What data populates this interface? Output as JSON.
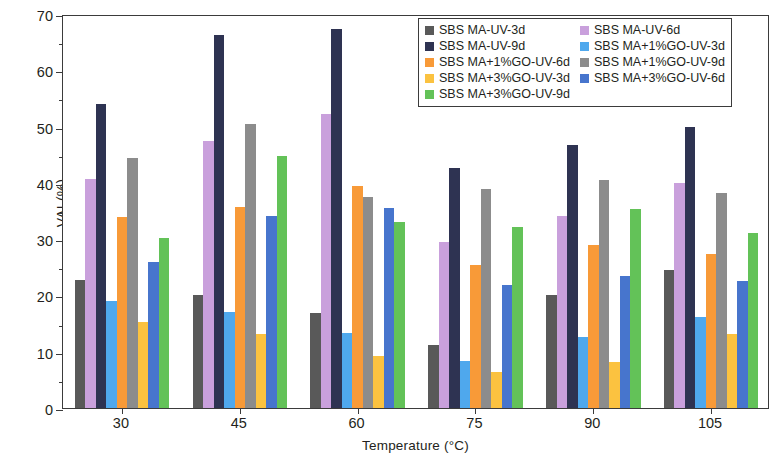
{
  "chart_data": {
    "type": "bar",
    "title": "",
    "xlabel": "Temperature (°C)",
    "ylabel": "VAI (%)",
    "categories": [
      "30",
      "45",
      "60",
      "75",
      "90",
      "105"
    ],
    "ylim": [
      0,
      70
    ],
    "ytick_major": [
      0,
      10,
      20,
      30,
      40,
      50,
      60,
      70
    ],
    "ytick_minor": [
      5,
      15,
      25,
      35,
      45,
      55,
      65
    ],
    "grid": false,
    "legend_position": "top-right inside",
    "series": [
      {
        "name": "SBS MA-UV-3d",
        "color": "#595959",
        "values": [
          22.7,
          20.1,
          16.8,
          11.2,
          20.1,
          24.6
        ]
      },
      {
        "name": "SBS MA-UV-6d",
        "color": "#c9a0dc",
        "values": [
          40.7,
          47.5,
          52.3,
          29.5,
          34.1,
          39.9
        ]
      },
      {
        "name": "SBS MA-UV-9d",
        "color": "#2e3352",
        "values": [
          54.0,
          66.3,
          67.3,
          42.7,
          46.8,
          49.9
        ]
      },
      {
        "name": "SBS MA+1%GO-UV-3d",
        "color": "#4fa8ed",
        "values": [
          19.0,
          17.1,
          13.3,
          8.3,
          12.6,
          16.1
        ]
      },
      {
        "name": "SBS MA+1%GO-UV-6d",
        "color": "#f89a38",
        "values": [
          34.0,
          35.7,
          39.5,
          25.4,
          29.0,
          27.4
        ]
      },
      {
        "name": "SBS MA+1%GO-UV-9d",
        "color": "#8c8c8c",
        "values": [
          44.4,
          50.4,
          37.5,
          39.0,
          40.5,
          38.2
        ]
      },
      {
        "name": "SBS MA+3%GO-UV-3d",
        "color": "#fbc240",
        "values": [
          15.3,
          13.2,
          9.2,
          6.4,
          8.1,
          13.2
        ]
      },
      {
        "name": "SBS MA+3%GO-UV-6d",
        "color": "#4775cd",
        "values": [
          26.0,
          34.1,
          35.5,
          21.8,
          23.4,
          22.5
        ]
      },
      {
        "name": "SBS MA+3%GO-UV-9d",
        "color": "#63c258",
        "values": [
          30.2,
          44.8,
          33.0,
          32.1,
          35.4,
          31.1
        ]
      }
    ]
  },
  "legend": {
    "items": [
      {
        "label": "SBS MA-UV-3d",
        "color": "#595959"
      },
      {
        "label": "SBS MA-UV-9d",
        "color": "#2e3352"
      },
      {
        "label": "SBS MA+1%GO-UV-6d",
        "color": "#f89a38"
      },
      {
        "label": "SBS MA+3%GO-UV-3d",
        "color": "#fbc240"
      },
      {
        "label": "SBS MA+3%GO-UV-9d",
        "color": "#63c258"
      },
      {
        "label": "SBS MA-UV-6d",
        "color": "#c9a0dc"
      },
      {
        "label": "SBS MA+1%GO-UV-3d",
        "color": "#4fa8ed"
      },
      {
        "label": "SBS MA+1%GO-UV-9d",
        "color": "#8c8c8c"
      },
      {
        "label": "SBS MA+3%GO-UV-6d",
        "color": "#4775cd"
      }
    ]
  },
  "axes": {
    "y_title": "VAI (%)",
    "x_title": "Temperature (°C)",
    "y_ticks": [
      "0",
      "10",
      "20",
      "30",
      "40",
      "50",
      "60",
      "70"
    ],
    "x_ticks": [
      "30",
      "45",
      "60",
      "75",
      "90",
      "105"
    ]
  },
  "colors": {
    "frame": "#3b3b3b",
    "text": "#231f20",
    "background": "#ffffff"
  }
}
